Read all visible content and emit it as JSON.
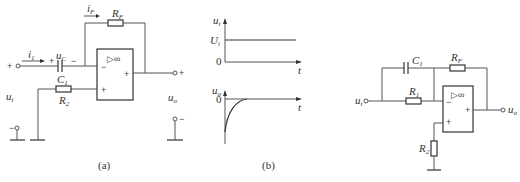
{
  "figure_a": {
    "caption": "(a)",
    "labels": {
      "i1": {
        "main": "i",
        "sub": "1"
      },
      "uC": {
        "main": "u",
        "sub": "C"
      },
      "C1": {
        "main": "C",
        "sub": "1"
      },
      "iF": {
        "main": "i",
        "sub": "F"
      },
      "RF": {
        "main": "R",
        "sub": "F"
      },
      "R2": {
        "main": "R",
        "sub": "2"
      },
      "ui": {
        "main": "u",
        "sub": "i"
      },
      "uo": {
        "main": "u",
        "sub": "o"
      }
    },
    "signs": {
      "in_plus": "+",
      "in_minus": "−",
      "cap_plus": "+",
      "cap_minus": "−",
      "out_plus": "+",
      "out_minus": "−"
    },
    "opamp": {
      "symbol": "▷∞",
      "inv": "−",
      "noninv": "+",
      "out": "+"
    }
  },
  "figure_b": {
    "caption": "(b)",
    "top_plot": {
      "ylabel_main": "u",
      "ylabel_sub": "i",
      "level_main": "U",
      "level_sub": "i",
      "origin": "0",
      "xlabel": "t"
    },
    "bottom_plot": {
      "ylabel_main": "u",
      "ylabel_sub": "o",
      "origin": "0",
      "xlabel": "t"
    }
  },
  "figure_c": {
    "labels": {
      "C1": {
        "main": "C",
        "sub": "1"
      },
      "RF": {
        "main": "R",
        "sub": "F"
      },
      "R1": {
        "main": "R",
        "sub": "1"
      },
      "R2": {
        "main": "R",
        "sub": "2"
      },
      "ui": {
        "main": "u",
        "sub": "i"
      },
      "uo": {
        "main": "u",
        "sub": "o"
      }
    },
    "opamp": {
      "symbol": "▷∞",
      "inv": "−",
      "noninv": "+",
      "out": "+"
    }
  }
}
